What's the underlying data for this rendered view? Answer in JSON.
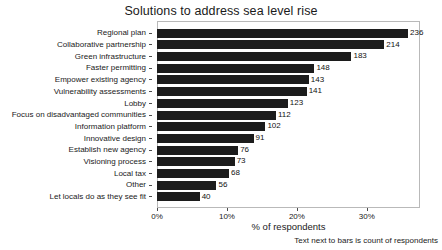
{
  "chart_data": {
    "type": "bar",
    "orientation": "horizontal",
    "title": "Solutions to address sea level rise",
    "xlabel": "% of respondents",
    "ylabel": "",
    "caption": "Text next to bars is count of respondents",
    "grid": false,
    "legend": "none",
    "xlim": [
      0,
      37.6
    ],
    "xticks": [
      0,
      10,
      20,
      30
    ],
    "xticklabels": [
      "0%",
      "10%",
      "20%",
      "30%"
    ],
    "total_respondents": 658,
    "categories": [
      "Regional plan",
      "Collaborative partnership",
      "Green infrastructure",
      "Faster permitting",
      "Empower existing agency",
      "Vulnerability assessments",
      "Lobby",
      "Focus on disadvantaged communities",
      "Information platform",
      "Innovative design",
      "Establish new agency",
      "Visioning process",
      "Local tax",
      "Other",
      "Let locals do as they see fit"
    ],
    "values": [
      236,
      214,
      183,
      148,
      143,
      141,
      123,
      112,
      102,
      91,
      76,
      73,
      68,
      56,
      40
    ],
    "percent_values": [
      35.9,
      32.5,
      27.8,
      22.5,
      21.7,
      21.4,
      18.7,
      17.0,
      15.5,
      13.8,
      11.6,
      11.1,
      10.3,
      8.5,
      6.1
    ],
    "datalabels": [
      "236",
      "214",
      "183",
      "148",
      "143",
      "141",
      "123",
      "112",
      "102",
      "91",
      "76",
      "73",
      "68",
      "56",
      "40"
    ],
    "bar_color": "#1c1c1c",
    "background_color": "#ffffff",
    "frame_color": "#b9b9b9"
  }
}
